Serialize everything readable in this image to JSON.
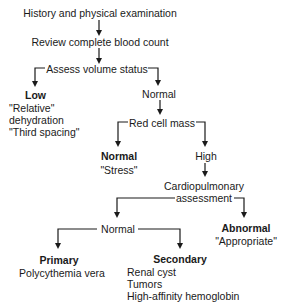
{
  "flowchart": {
    "step1": "History and physical examination",
    "step2": "Review complete blood count",
    "step3": "Assess volume status",
    "volume_low": {
      "label": "Low",
      "lines": [
        "\"Relative\"",
        "dehydration",
        "\"Third spacing\""
      ]
    },
    "volume_normal": "Normal",
    "step4": "Red cell mass",
    "rcm_normal": {
      "label": "Normal",
      "lines": [
        "\"Stress\""
      ]
    },
    "rcm_high": "High",
    "step5": [
      "Cardiopulmonary",
      "assessment"
    ],
    "cardio_normal": "Normal",
    "cardio_abnormal": {
      "label": "Abnormal",
      "lines": [
        "\"Appropriate\""
      ]
    },
    "primary": {
      "label": "Primary",
      "lines": [
        "Polycythemia vera"
      ]
    },
    "secondary": {
      "label": "Secondary",
      "lines": [
        "Renal cyst",
        "Tumors",
        "High-affinity hemoglobin"
      ]
    }
  }
}
